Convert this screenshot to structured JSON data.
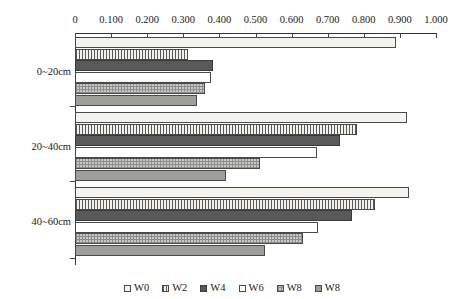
{
  "chart_data": {
    "type": "bar",
    "orientation": "horizontal",
    "title": "",
    "xlabel": "",
    "ylabel": "",
    "xlim": [
      0,
      1.0
    ],
    "grid": false,
    "legend_position": "bottom",
    "xticks": [
      "0",
      "0.100",
      "0.200",
      "0.300",
      "0.400",
      "0.500",
      "0.600",
      "0.700",
      "0.800",
      "0.900",
      "1.000"
    ],
    "xtick_values": [
      0,
      0.1,
      0.2,
      0.3,
      0.4,
      0.5,
      0.6,
      0.7,
      0.8,
      0.9,
      1.0
    ],
    "categories": [
      "0~20cm",
      "20~40cm",
      "40~60cm"
    ],
    "series": [
      {
        "name": "W0",
        "pattern": "light-solid",
        "values": [
          0.89,
          0.92,
          0.925
        ]
      },
      {
        "name": "W2",
        "pattern": "vertical-lines",
        "values": [
          0.313,
          0.78,
          0.83
        ]
      },
      {
        "name": "W4",
        "pattern": "dark-solid",
        "values": [
          0.383,
          0.735,
          0.768
        ]
      },
      {
        "name": "W6",
        "pattern": "white-outline",
        "values": [
          0.377,
          0.67,
          0.673
        ]
      },
      {
        "name": "W8",
        "pattern": "checker-gray",
        "values": [
          0.36,
          0.512,
          0.632
        ]
      },
      {
        "name": "W8",
        "pattern": "medium-solid",
        "values": [
          0.338,
          0.418,
          0.527
        ]
      }
    ]
  },
  "legend": {
    "items": [
      {
        "label": "W0"
      },
      {
        "label": "W2"
      },
      {
        "label": "W4"
      },
      {
        "label": "W6"
      },
      {
        "label": "W8"
      },
      {
        "label": "W8"
      }
    ]
  },
  "colors": {
    "axis": "#333333",
    "text": "#1a1a1a",
    "w0": "#f4f3ee",
    "w2": "#5a5a5a",
    "w4": "#595959",
    "w6": "#ffffff",
    "w8a": "#c9c9c4",
    "w8b": "#9e9e9a"
  }
}
